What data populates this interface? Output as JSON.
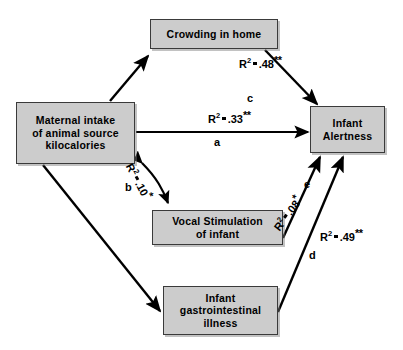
{
  "figure": {
    "type": "path-diagram",
    "background_color": "#ffffff",
    "box_fill_color": "#cccccc",
    "box_border_color": "#3a3a3a",
    "line_color": "#000000"
  },
  "nodes": [
    {
      "id": "crowding",
      "label": "Crowding in home"
    },
    {
      "id": "maternal",
      "label": "Maternal intake\nof animal source\nkilocalories"
    },
    {
      "id": "alertness",
      "label": "Infant\nAlertness"
    },
    {
      "id": "vocal",
      "label": "Vocal Stimulation\nof infant"
    },
    {
      "id": "gi",
      "label": "Infant\ngastrointestinal\nillness"
    }
  ],
  "paths": [
    {
      "letter": "c",
      "from": "crowding",
      "to": "alertness",
      "statistic": "R",
      "exponent": "2",
      "relation": "=",
      "value": ".48",
      "significance": "**"
    },
    {
      "letter": "a",
      "from": "maternal",
      "to": "alertness",
      "statistic": "R",
      "exponent": "2",
      "relation": "=",
      "value": ".33",
      "significance": "**"
    },
    {
      "letter": "b",
      "from": "maternal",
      "to": "vocal",
      "statistic": "R",
      "exponent": "2",
      "relation": "=",
      "value": ".10",
      "significance": "*"
    },
    {
      "letter": "e",
      "from": "vocal",
      "to": "alertness",
      "statistic": "R",
      "exponent": "2",
      "relation": "=",
      "value": ".08",
      "significance": "*"
    },
    {
      "letter": "d",
      "from": "gi",
      "to": "alertness",
      "statistic": "R",
      "exponent": "2",
      "relation": "=",
      "value": ".49",
      "significance": "**"
    }
  ],
  "unlabeled_paths": [
    {
      "from": "maternal",
      "to": "crowding"
    },
    {
      "from": "maternal",
      "to": "gi"
    }
  ]
}
